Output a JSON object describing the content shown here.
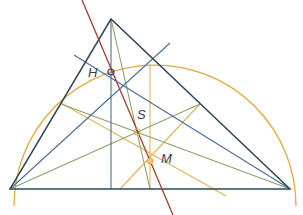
{
  "diagram": {
    "points": {
      "A": [
        10,
        189
      ],
      "B": [
        290,
        189
      ],
      "C": [
        111,
        19
      ],
      "H": [
        111,
        72
      ],
      "S": [
        137,
        132
      ],
      "M": [
        150,
        161
      ]
    },
    "labels": [
      {
        "id": "H",
        "text": "H",
        "x": 90,
        "y": 66
      },
      {
        "id": "S",
        "text": "S",
        "x": 137,
        "y": 106
      },
      {
        "id": "M",
        "text": "M",
        "x": 162,
        "y": 150
      }
    ],
    "colors": {
      "triangle": "#2f4858",
      "altitudes": "#4a6e9a",
      "medians": "#8aa36a",
      "bisectors": "#e0b45a",
      "euler_line": "#a0402a",
      "circumcircle": "#e6a83a"
    },
    "legend": {
      "H": "orthocenter",
      "S": "centroid",
      "M": "circumcenter"
    }
  }
}
